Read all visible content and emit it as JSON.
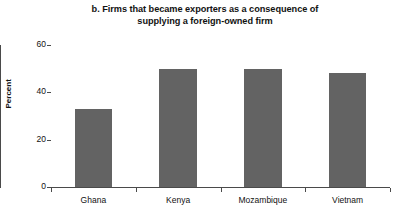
{
  "chart_data": {
    "type": "bar",
    "title": "b. Firms that became exporters as a consequence of supplying a foreign-owned firm",
    "title_lines": [
      "b. Firms that became exporters as a consequence of",
      "supplying a foreign-owned firm"
    ],
    "categories": [
      "Ghana",
      "Kenya",
      "Mozambique",
      "Vietnam"
    ],
    "values": [
      33,
      50,
      50,
      48
    ],
    "xlabel": "",
    "ylabel": "Percent",
    "ylim": [
      0,
      60
    ],
    "yticks": [
      0,
      20,
      40,
      60
    ],
    "ytick_labels": [
      "0",
      "20",
      "40",
      "60"
    ],
    "grid": false,
    "legend": false,
    "bar_color": "#636363",
    "axis_color": "#4a4a4a",
    "background_color": "#ffffff"
  }
}
